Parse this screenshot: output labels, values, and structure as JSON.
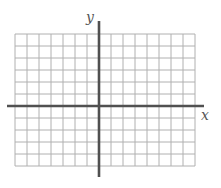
{
  "diagram": {
    "type": "coordinate-plane",
    "x_axis_label": "x",
    "y_axis_label": "y",
    "grid": {
      "columns_left_of_y_axis": 7,
      "columns_right_of_y_axis": 8,
      "rows_above_x_axis": 6,
      "rows_below_x_axis": 5,
      "cell_size_px": 12
    },
    "colors": {
      "grid_line": "#b0b0b0",
      "axis_line": "#505050",
      "label": "#555555",
      "background": "#ffffff"
    }
  }
}
